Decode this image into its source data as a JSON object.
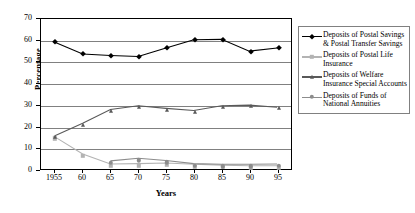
{
  "chart_data": {
    "type": "line",
    "title": "",
    "xlabel": "Years",
    "ylabel": "Percentage",
    "categories": [
      "1955",
      "60",
      "65",
      "70",
      "75",
      "80",
      "85",
      "90",
      "95"
    ],
    "ylim": [
      0,
      70
    ],
    "yticks": [
      0,
      10,
      20,
      30,
      40,
      50,
      60,
      70
    ],
    "grid": true,
    "legend_position": "right",
    "series": [
      {
        "name": "Deposits of Postal Savings & Postal Transfer Savings",
        "marker": "diamond",
        "color": "#000000",
        "values": [
          59.2,
          53.7,
          53.0,
          52.5,
          56.5,
          60.3,
          60.5,
          55.0,
          56.5
        ]
      },
      {
        "name": "Deposits of Postal Life Insurance",
        "marker": "square",
        "color": "#b3b3b3",
        "values": [
          15.0,
          7.0,
          2.3,
          2.5,
          2.8,
          2.2,
          1.8,
          1.5,
          1.5
        ]
      },
      {
        "name": "Deposits of Welfare Insurance Special Accounts",
        "marker": "triangle",
        "color": "#595959",
        "values": [
          15.5,
          21.3,
          27.8,
          29.5,
          28.3,
          27.3,
          29.5,
          29.8,
          28.8
        ]
      },
      {
        "name": "Deposits of Funds of National Annuities",
        "marker": "circle",
        "color": "#8c8c8c",
        "values": [
          null,
          null,
          3.8,
          5.0,
          4.0,
          2.5,
          2.2,
          2.2,
          2.3
        ]
      }
    ]
  },
  "legend": {
    "entries": [
      {
        "label": "Deposits of Postal Savings & Postal Transfer Savings",
        "marker": "diamond",
        "color": "#000000"
      },
      {
        "label": "Deposits of Postal Life Insurance",
        "marker": "square",
        "color": "#b3b3b3"
      },
      {
        "label": "Deposits of Welfare Insurance Special Accounts",
        "marker": "triangle",
        "color": "#595959"
      },
      {
        "label": "Deposits of Funds of National Annuities",
        "marker": "circle",
        "color": "#8c8c8c"
      }
    ]
  }
}
